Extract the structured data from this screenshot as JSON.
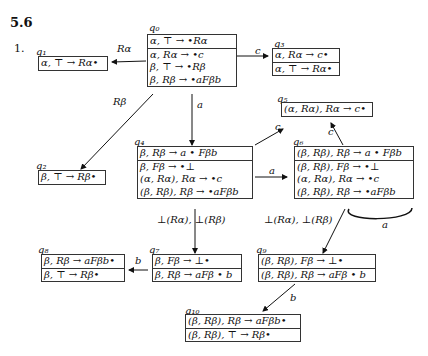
{
  "section": "5.6",
  "item_number": "1.",
  "states": [
    {
      "id": "q0",
      "label": "q₀",
      "kernel": [
        "α, ⊤ → •Rα"
      ],
      "closure": [
        "α, Rα → •c",
        "β, ⊤ → •Rβ",
        "β, Rβ → •aFβb"
      ]
    },
    {
      "id": "q1",
      "label": "q₁",
      "kernel": [
        "α, ⊤ → Rα•"
      ],
      "closure": []
    },
    {
      "id": "q2",
      "label": "q₂",
      "kernel": [
        "β, ⊤ → Rβ•"
      ],
      "closure": []
    },
    {
      "id": "q3",
      "label": "q₃",
      "kernel": [
        "α, Rα → c•"
      ],
      "closure": [
        "α, ⊤ → Rα•"
      ]
    },
    {
      "id": "q4",
      "label": "q₄",
      "kernel": [
        "β, Rβ → a • Fβb"
      ],
      "closure": [
        "β, Fβ → •⊥",
        "(α, Rα), Rα → •c",
        "(β, Rβ), Rβ → •aFβb"
      ]
    },
    {
      "id": "q5",
      "label": "q₅",
      "kernel": [
        "(α, Rα), Rα → c•"
      ],
      "closure": []
    },
    {
      "id": "q6",
      "label": "q₆",
      "kernel": [
        "(β, Rβ), Rβ → a • Fβb"
      ],
      "closure": [
        "(β, Rβ), Fβ → •⊥",
        "(α, Rα), Rα → •c",
        "(β, Rβ), Rβ → •aFβb"
      ]
    },
    {
      "id": "q7",
      "label": "q₇",
      "kernel": [
        "β, Fβ → ⊥•"
      ],
      "closure": [
        "β, Rβ → aFβ • b"
      ]
    },
    {
      "id": "q8",
      "label": "q₈",
      "kernel": [
        "β, Rβ → aFβb•"
      ],
      "closure": [
        "β, ⊤ → Rβ•"
      ]
    },
    {
      "id": "q9",
      "label": "q₉",
      "kernel": [
        "(β, Rβ), Fβ → ⊥•"
      ],
      "closure": [
        "(β, Rβ), Rβ → aFβ • b"
      ]
    },
    {
      "id": "q10",
      "label": "q₁₀",
      "kernel": [
        "(β, Rβ), Rβ → aFβb•"
      ],
      "closure": [
        "(β, Rβ), ⊤ → Rβ•"
      ]
    }
  ],
  "edges": [
    {
      "from": "q0",
      "to": "q1",
      "label": "Rα"
    },
    {
      "from": "q0",
      "to": "q3",
      "label": "c"
    },
    {
      "from": "q0",
      "to": "q2",
      "label": "Rβ"
    },
    {
      "from": "q0",
      "to": "q4",
      "label": "a"
    },
    {
      "from": "q4",
      "to": "q5",
      "label": "c"
    },
    {
      "from": "q4",
      "to": "q6",
      "label": "a"
    },
    {
      "from": "q6",
      "to": "q5",
      "label": "c"
    },
    {
      "from": "q6",
      "to": "q6",
      "label": "a"
    },
    {
      "from": "q4",
      "to": "q7",
      "label": "⊥(Rα), ⊥(Rβ)"
    },
    {
      "from": "q6",
      "to": "q9",
      "label": "⊥(Rα), ⊥(Rβ)"
    },
    {
      "from": "q7",
      "to": "q8",
      "label": "b"
    },
    {
      "from": "q9",
      "to": "q10",
      "label": "b"
    }
  ]
}
